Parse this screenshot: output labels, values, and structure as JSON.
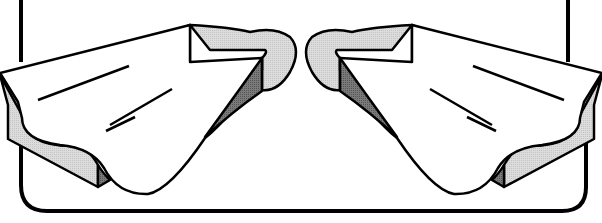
{
  "illustration": {
    "subject": "pair of swim fins",
    "caption_fragment": "",
    "colors": {
      "outline": "#000000",
      "background": "#ffffff",
      "light_shade": "#d4d4d4",
      "dark_shade": "#6e6e6e"
    }
  }
}
